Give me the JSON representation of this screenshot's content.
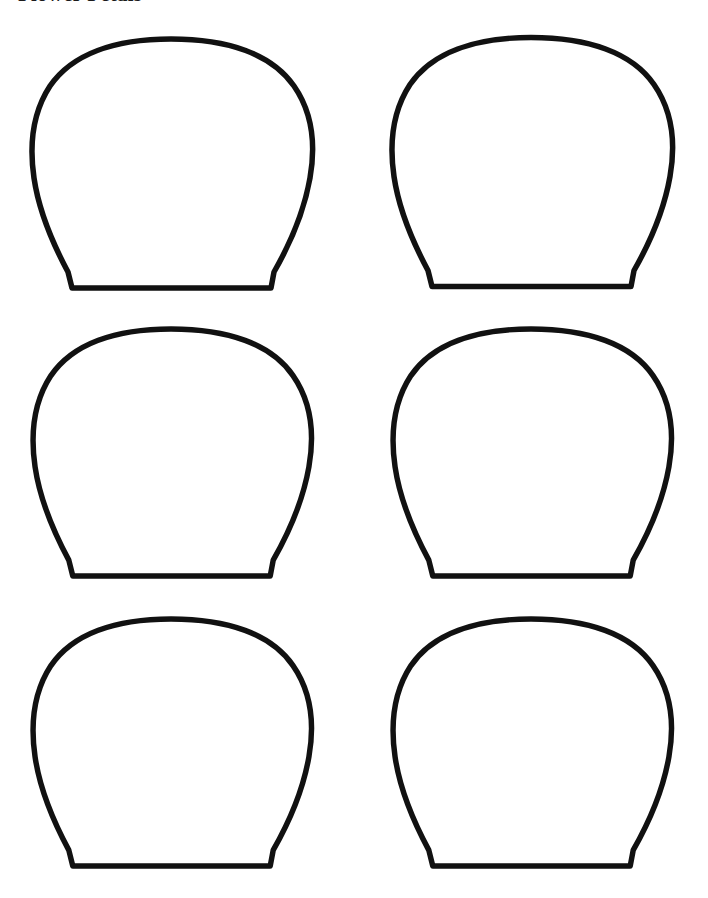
{
  "page": {
    "title": "Flower Petals",
    "title_clipped": true,
    "background_color": "#ffffff",
    "width": 708,
    "height": 898
  },
  "template": {
    "kind": "printable-cut-out-template",
    "shape_name": "petal-outline",
    "shape_description": "rounded dome top tapering to a narrow flat base with angled corners",
    "columns": 2,
    "rows": 3,
    "count": 6,
    "stroke_color": "#111111",
    "fill_color": "#ffffff",
    "stroke_width": 5.5
  },
  "shapes": [
    {
      "id": "petal-1",
      "row": 1,
      "column": 1,
      "x": 32,
      "y": 36,
      "width": 278,
      "height": 256
    },
    {
      "id": "petal-2",
      "row": 1,
      "column": 2,
      "x": 392,
      "y": 33,
      "width": 278,
      "height": 259
    },
    {
      "id": "petal-3",
      "row": 2,
      "column": 1,
      "x": 32,
      "y": 326,
      "width": 278,
      "height": 254
    },
    {
      "id": "petal-4",
      "row": 2,
      "column": 2,
      "x": 392,
      "y": 326,
      "width": 278,
      "height": 254
    },
    {
      "id": "petal-5",
      "row": 3,
      "column": 1,
      "x": 32,
      "y": 616,
      "width": 278,
      "height": 254
    },
    {
      "id": "petal-6",
      "row": 3,
      "column": 2,
      "x": 392,
      "y": 616,
      "width": 278,
      "height": 254
    }
  ],
  "geometry": {
    "viewbox": "0 0 278 256",
    "path": "M 139 3 C 196 3 240 18 262 50 C 280 76 284 108 278 142 C 272 176 258 208 242 236 L 239 252 L 40 252 L 36 236 C 21 208 7 176 2 142 C -3 108 1 76 18 50 C 40 18 83 3 139 3 Z"
  }
}
